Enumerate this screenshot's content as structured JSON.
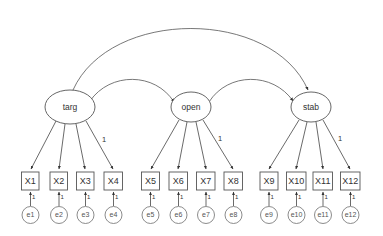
{
  "diagram": {
    "type": "sem-path-diagram",
    "title": "",
    "background_color": "#ffffff",
    "stroke_color": "#555555",
    "latent_variables": [
      {
        "id": "targ",
        "label": "targ",
        "cx": 70,
        "cy": 107,
        "rx": 25,
        "ry": 17
      },
      {
        "id": "open",
        "label": "open",
        "cx": 191,
        "cy": 107,
        "rx": 20,
        "ry": 15
      },
      {
        "id": "stab",
        "label": "stab",
        "cx": 311,
        "cy": 107,
        "rx": 20,
        "ry": 15
      }
    ],
    "indicators": [
      {
        "id": "X1",
        "label": "X1",
        "x": 21.5,
        "y": 172,
        "w": 17.5,
        "h": 18,
        "factor": "targ"
      },
      {
        "id": "X2",
        "label": "X2",
        "x": 50.0,
        "y": 172,
        "w": 17.5,
        "h": 18,
        "factor": "targ"
      },
      {
        "id": "X3",
        "label": "X3",
        "x": 76.5,
        "y": 172,
        "w": 17.5,
        "h": 18,
        "factor": "targ"
      },
      {
        "id": "X4",
        "label": "X4",
        "x": 104.0,
        "y": 172,
        "w": 18.5,
        "h": 18,
        "factor": "targ"
      },
      {
        "id": "X5",
        "label": "X5",
        "x": 141.5,
        "y": 172,
        "w": 18.0,
        "h": 18,
        "factor": "open"
      },
      {
        "id": "X6",
        "label": "X6",
        "x": 169.0,
        "y": 172,
        "w": 18.5,
        "h": 18,
        "factor": "open"
      },
      {
        "id": "X7",
        "label": "X7",
        "x": 196.5,
        "y": 172,
        "w": 18.5,
        "h": 18,
        "factor": "open"
      },
      {
        "id": "X8",
        "label": "X8",
        "x": 224.0,
        "y": 172,
        "w": 18.5,
        "h": 18,
        "factor": "open"
      },
      {
        "id": "X9",
        "label": "X9",
        "x": 260.0,
        "y": 172,
        "w": 18.0,
        "h": 18,
        "factor": "stab"
      },
      {
        "id": "X10",
        "label": "X10",
        "x": 286.5,
        "y": 172,
        "w": 19.5,
        "h": 18,
        "factor": "stab"
      },
      {
        "id": "X11",
        "label": "X11",
        "x": 313.0,
        "y": 172,
        "w": 19.5,
        "h": 18,
        "factor": "stab"
      },
      {
        "id": "X12",
        "label": "X12",
        "x": 340.5,
        "y": 172,
        "w": 19.5,
        "h": 18,
        "factor": "stab"
      }
    ],
    "errors": [
      {
        "id": "e1",
        "label": "e1",
        "cx": 30.5,
        "cy": 215,
        "r": 8.5,
        "target": "X1"
      },
      {
        "id": "e2",
        "label": "e2",
        "cx": 59.0,
        "cy": 215,
        "r": 8.5,
        "target": "X2"
      },
      {
        "id": "e3",
        "label": "e3",
        "cx": 85.5,
        "cy": 215,
        "r": 8.5,
        "target": "X3"
      },
      {
        "id": "e4",
        "label": "e4",
        "cx": 113.5,
        "cy": 215,
        "r": 8.5,
        "target": "X4"
      },
      {
        "id": "e5",
        "label": "e5",
        "cx": 150.5,
        "cy": 215,
        "r": 8.5,
        "target": "X5"
      },
      {
        "id": "e6",
        "label": "e6",
        "cx": 178.5,
        "cy": 215,
        "r": 8.5,
        "target": "X6"
      },
      {
        "id": "e7",
        "label": "e7",
        "cx": 206.0,
        "cy": 215,
        "r": 8.5,
        "target": "X7"
      },
      {
        "id": "e8",
        "label": "e8",
        "cx": 233.5,
        "cy": 215,
        "r": 8.5,
        "target": "X8"
      },
      {
        "id": "e9",
        "label": "e9",
        "cx": 269.0,
        "cy": 215,
        "r": 8.5,
        "target": "X9"
      },
      {
        "id": "e10",
        "label": "e10",
        "cx": 296.5,
        "cy": 215,
        "r": 8.5,
        "target": "X10"
      },
      {
        "id": "e11",
        "label": "e11",
        "cx": 323.0,
        "cy": 215,
        "r": 8.5,
        "target": "X11"
      },
      {
        "id": "e12",
        "label": "e12",
        "cx": 350.5,
        "cy": 215,
        "r": 8.5,
        "target": "X12"
      }
    ],
    "loadings_fixed": [
      {
        "from": "targ",
        "to": "X4",
        "value": "1",
        "lx": 104,
        "ly": 140
      },
      {
        "from": "open",
        "to": "X8",
        "value": "1",
        "lx": 220,
        "ly": 139
      },
      {
        "from": "stab",
        "to": "X12",
        "value": "1",
        "lx": 340,
        "ly": 139
      }
    ],
    "error_loadings_fixed": [
      {
        "from": "e1",
        "to": "X1",
        "value": "1"
      },
      {
        "from": "e2",
        "to": "X2",
        "value": "1"
      },
      {
        "from": "e3",
        "to": "X3",
        "value": "1"
      },
      {
        "from": "e4",
        "to": "X4",
        "value": "1"
      },
      {
        "from": "e5",
        "to": "X5",
        "value": "1"
      },
      {
        "from": "e6",
        "to": "X6",
        "value": "1"
      },
      {
        "from": "e7",
        "to": "X7",
        "value": "1"
      },
      {
        "from": "e8",
        "to": "X8",
        "value": "1"
      },
      {
        "from": "e9",
        "to": "X9",
        "value": "1"
      },
      {
        "from": "e10",
        "to": "X10",
        "value": "1"
      },
      {
        "from": "e11",
        "to": "X11",
        "value": "1"
      },
      {
        "from": "e12",
        "to": "X12",
        "value": "1"
      }
    ],
    "covariances": [
      {
        "id": "cov-targ-stab",
        "from": "targ",
        "to": "stab",
        "label": ""
      },
      {
        "id": "cov-targ-open",
        "from": "targ",
        "to": "open",
        "label": ""
      },
      {
        "id": "cov-open-stab",
        "from": "open",
        "to": "stab",
        "label": ""
      }
    ]
  }
}
